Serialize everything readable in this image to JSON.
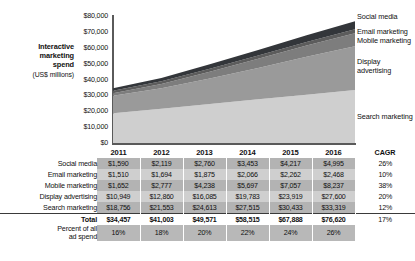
{
  "chart_data": {
    "type": "area",
    "stacked": true,
    "title": "",
    "xlabel": "",
    "ylabel": "Interactive marketing spend (US$ millions)",
    "ylim": [
      0,
      80000
    ],
    "ytick_labels": [
      "$80,000",
      "$70,000",
      "$60,000",
      "$50,000",
      "$40,000",
      "$30,000",
      "$20,000",
      "$10,000",
      "$0"
    ],
    "ytick_values": [
      80000,
      70000,
      60000,
      50000,
      40000,
      30000,
      20000,
      10000,
      0
    ],
    "grid": false,
    "legend_position": "right",
    "categories": [
      "2011",
      "2012",
      "2013",
      "2014",
      "2015",
      "2016"
    ],
    "series": [
      {
        "name": "Search marketing",
        "values": [
          18756,
          21553,
          24613,
          27515,
          30433,
          33319
        ],
        "color": "#cfcfcf",
        "order": 1
      },
      {
        "name": "Display advertising",
        "values": [
          10949,
          12860,
          16085,
          19783,
          23919,
          27600
        ],
        "color": "#9a9a9a",
        "order": 2
      },
      {
        "name": "Mobile marketing",
        "values": [
          1652,
          2777,
          4238,
          5697,
          7057,
          8237
        ],
        "color": "#7d7d7d",
        "order": 3
      },
      {
        "name": "Email marketing",
        "values": [
          1510,
          1694,
          1875,
          2066,
          2262,
          2468
        ],
        "color": "#5c5c5c",
        "order": 4
      },
      {
        "name": "Social media",
        "values": [
          1590,
          2119,
          2760,
          3453,
          4217,
          4995
        ],
        "color": "#33363a",
        "order": 5
      }
    ],
    "totals": [
      34457,
      41003,
      49571,
      58515,
      67888,
      76620
    ]
  },
  "axis": {
    "title_line1": "Interactive",
    "title_line2": "marketing",
    "title_line3": "spend",
    "title_unit": "(US$ millions)"
  },
  "series_labels": {
    "social": "Social media",
    "email": "Email marketing",
    "mobile": "Mobile marketing",
    "display_line1": "Display",
    "display_line2": "advertising",
    "search": "Search marketing"
  },
  "table": {
    "year_headers": [
      "2011",
      "2012",
      "2013",
      "2014",
      "2015",
      "2016"
    ],
    "cagr_header": "CAGR",
    "rows": [
      {
        "label": "Social media",
        "values": [
          "$1,590",
          "$2,119",
          "$2,760",
          "$3,453",
          "$4,217",
          "$4,995"
        ],
        "cagr": "26%"
      },
      {
        "label": "Email marketing",
        "values": [
          "$1,510",
          "$1,694",
          "$1,875",
          "$2,066",
          "$2,262",
          "$2,468"
        ],
        "cagr": "10%"
      },
      {
        "label": "Mobile marketing",
        "values": [
          "$1,652",
          "$2,777",
          "$4,238",
          "$5,697",
          "$7,057",
          "$8,237"
        ],
        "cagr": "38%"
      },
      {
        "label": "Display advertising",
        "values": [
          "$10,949",
          "$12,860",
          "$16,085",
          "$19,783",
          "$23,919",
          "$27,600"
        ],
        "cagr": "20%"
      },
      {
        "label": "Search marketing",
        "values": [
          "$18,756",
          "$21,553",
          "$24,613",
          "$27,515",
          "$30,433",
          "$33,319"
        ],
        "cagr": "12%"
      }
    ],
    "total_row": {
      "label": "Total",
      "values": [
        "$34,457",
        "$41,003",
        "$49,571",
        "$58,515",
        "$67,888",
        "$76,620"
      ],
      "cagr": "17%"
    },
    "percent_row": {
      "label_line1": "Percent of all",
      "label_line2": "ad spend",
      "values": [
        "16%",
        "18%",
        "20%",
        "22%",
        "24%",
        "26%"
      ],
      "cagr": ""
    }
  },
  "colors": {
    "social": "#33363a",
    "email": "#5c5c5c",
    "mobile": "#7d7d7d",
    "display": "#9a9a9a",
    "search": "#cfcfcf",
    "table_dark": "#b3b3b3",
    "table_light": "#cfcfcf",
    "axis": "#5a5a5a"
  }
}
